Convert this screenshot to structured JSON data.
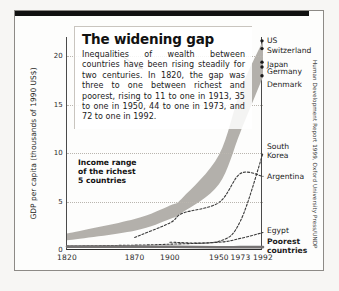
{
  "figure": {
    "title": "The widening gap",
    "body": "Inequalities of wealth between countries have been rising steadily for two centuries. In 1820, the gap was three to one between richest and poorest, rising to 11 to one in 1913, 35 to one in 1950, 44 to one in 1973, and 72 to one in 1992.",
    "annotation": "Income range\nof the richest\n5 countries",
    "source": "Human Development Report 1999, Oxford University Press/UNDP"
  },
  "chart_data": {
    "type": "line",
    "title": "The widening gap",
    "xlabel": "",
    "ylabel": "GDP per capita (thousands of 1990 US$)",
    "xlim": [
      1820,
      1992
    ],
    "ylim": [
      0,
      22
    ],
    "grid": true,
    "legend": "right-edge-labels",
    "xticks": [
      1820,
      1870,
      1900,
      1950,
      1973,
      1992
    ],
    "xtick_labels": [
      "1820",
      "1870",
      "1900",
      "1950",
      "1973",
      "1992"
    ],
    "yticks": [
      0,
      5,
      10,
      15,
      20
    ],
    "ytick_labels": [
      "0",
      "5",
      "10",
      "15",
      "20"
    ],
    "band": {
      "name": "Income range of the richest 5 countries",
      "color": "#b3b0ab",
      "x": [
        1820,
        1870,
        1900,
        1913,
        1950,
        1973,
        1992
      ],
      "upper": [
        1.7,
        3.2,
        4.6,
        5.4,
        9.8,
        16.5,
        21.6
      ],
      "lower": [
        1.0,
        2.0,
        3.2,
        3.9,
        6.8,
        12.2,
        17.9
      ]
    },
    "endpoint_markers": [
      {
        "label": "US",
        "value": 21.6
      },
      {
        "label": "Switzerland",
        "value": 20.8
      },
      {
        "label": "Japan",
        "value": 19.4
      },
      {
        "label": "Germany",
        "value": 18.9
      },
      {
        "label": "Denmark",
        "value": 18.0
      }
    ],
    "series": [
      {
        "name": "South Korea",
        "style": "dashed",
        "color": "#3a3a3a",
        "x": [
          1900,
          1950,
          1973,
          1992
        ],
        "values": [
          0.8,
          0.9,
          3.0,
          10.0
        ]
      },
      {
        "name": "Argentina",
        "style": "dashed",
        "color": "#3a3a3a",
        "x": [
          1870,
          1900,
          1913,
          1950,
          1973,
          1992
        ],
        "values": [
          1.3,
          2.8,
          3.8,
          4.9,
          7.9,
          7.6
        ]
      },
      {
        "name": "Egypt",
        "style": "dashed",
        "color": "#3a3a3a",
        "x": [
          1820,
          1870,
          1900,
          1950,
          1973,
          1992
        ],
        "values": [
          0.4,
          0.5,
          0.6,
          0.8,
          1.2,
          1.8
        ]
      },
      {
        "name": "Poorest countries",
        "style": "solid-thick",
        "color": "#767373",
        "x": [
          1820,
          1870,
          1900,
          1950,
          1973,
          1992
        ],
        "values": [
          0.35,
          0.35,
          0.33,
          0.28,
          0.3,
          0.3
        ]
      }
    ],
    "right_labels": [
      {
        "text": "US",
        "value": 21.6,
        "bold": false
      },
      {
        "text": "Switzerland",
        "value": 20.6,
        "bold": false
      },
      {
        "text": "Japan",
        "value": 19.2,
        "bold": false
      },
      {
        "text": "Germany",
        "value": 18.4,
        "bold": false
      },
      {
        "text": "Denmark",
        "value": 17.1,
        "bold": false
      },
      {
        "text": "South\nKorea",
        "value": 10.2,
        "bold": false
      },
      {
        "text": "Argentina",
        "value": 7.6,
        "bold": false
      },
      {
        "text": "Egypt",
        "value": 2.0,
        "bold": false
      },
      {
        "text": "Poorest\ncountries",
        "value": 0.4,
        "bold": true
      }
    ]
  }
}
